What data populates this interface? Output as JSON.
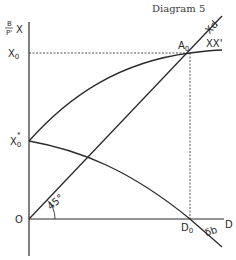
{
  "title": "Diagram 5",
  "axes": {
    "y_label_numerator": "B",
    "y_label_denominator": "P'",
    "y_label_suffix": "X",
    "x_label": "D",
    "origin_label": "O"
  },
  "points": {
    "x0": "X",
    "x0_sub": "0",
    "x0_star": "X",
    "x0_star_sub": "0",
    "x0_star_sup": "*",
    "a0": "A",
    "a0_sub": "0",
    "d0": "D",
    "d0_sub": "0"
  },
  "curves": {
    "xd": "Xd",
    "xx": "XX'",
    "db": "δb"
  },
  "angle_label": "45°"
}
